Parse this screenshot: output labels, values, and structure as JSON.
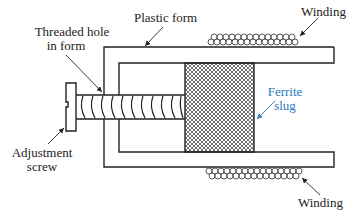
{
  "diagram": {
    "labels": {
      "plastic_form": "Plastic form",
      "threaded_hole_line1": "Threaded hole",
      "threaded_hole_line2": "in form",
      "winding_top": "Winding",
      "winding_bottom": "Winding",
      "ferrite_line1": "Ferrite",
      "ferrite_line2": "slug",
      "adjustment_line1": "Adjustment",
      "adjustment_line2": "screw"
    },
    "colors": {
      "line": "#222222",
      "accent_label": "#2a7ac0",
      "background": "#ffffff"
    }
  }
}
